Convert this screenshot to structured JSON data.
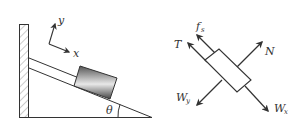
{
  "left_figure": {
    "axes": {
      "x_label": "x",
      "y_label": "y"
    },
    "angle_label": "θ",
    "components": [
      "wall",
      "ground",
      "incline",
      "rope",
      "block"
    ]
  },
  "right_figure": {
    "forces": {
      "tension": "T",
      "friction": "f",
      "friction_sub": "s",
      "normal": "N",
      "weight_y": "W",
      "weight_y_sub": "y",
      "weight_x": "W",
      "weight_x_sub": "x"
    }
  },
  "colors": {
    "line": "#333333",
    "hatch": "#888888",
    "block_dark": "#555555",
    "block_light": "#ffffff"
  }
}
